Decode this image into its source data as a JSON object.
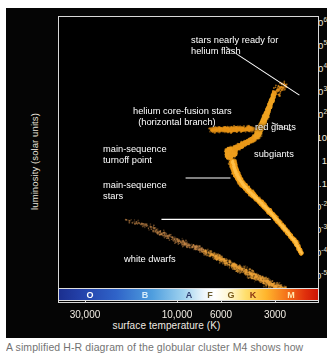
{
  "figure": {
    "background_color": "#050505",
    "plot_background": "#000000",
    "frame_color": "#d8d8d8",
    "text_color": "#ffffff",
    "star_color": "#f5a623",
    "caption": "A simplified H-R diagram of the globular cluster M4 shows how"
  },
  "chart_data": {
    "type": "scatter",
    "title": "",
    "xlabel": "surface temperature (K)",
    "ylabel": "luminosity (solar units)",
    "xscale": "log-reversed",
    "yscale": "log",
    "xlim": [
      45000,
      2400
    ],
    "ylim": [
      1e-05,
      1000000.0
    ],
    "grid": false,
    "legend_position": "none",
    "x_tick_labels": [
      "30,000",
      "10,000",
      "6000",
      "3000"
    ],
    "x_tick_values": [
      30000,
      10000,
      6000,
      3000
    ],
    "y_tick_labels": [
      "10⁶",
      "10⁵",
      "10⁴",
      "10³",
      "10²",
      "10",
      "1",
      "0.1",
      "10⁻²",
      "10⁻³",
      "10⁻⁴",
      "10⁻⁵"
    ],
    "y_tick_values": [
      1000000,
      100000,
      10000,
      1000,
      100,
      10,
      1,
      0.1,
      0.01,
      0.001,
      0.0001,
      1e-05
    ],
    "spectral_classes": [
      {
        "label": "O",
        "color": "#ffffff",
        "temp": 33000
      },
      {
        "label": "B",
        "color": "#cfe8fb",
        "temp": 15500
      },
      {
        "label": "A",
        "color": "#2a3a6b",
        "temp": 8800
      },
      {
        "label": "F",
        "color": "#6a5a2a",
        "temp": 7000
      },
      {
        "label": "G",
        "color": "#7a5a18",
        "temp": 5800
      },
      {
        "label": "K",
        "color": "#8a3410",
        "temp": 4500
      },
      {
        "label": "M",
        "color": "#ffe7b0",
        "temp": 3100
      }
    ],
    "series": [
      {
        "name": "main sequence",
        "description": "dense orange band from turnoff point down to low-mass dwarfs",
        "points": [
          [
            6400,
            3.0
          ],
          [
            6350,
            2.2
          ],
          [
            6280,
            1.6
          ],
          [
            6200,
            1.2
          ],
          [
            6120,
            0.95
          ],
          [
            6050,
            0.8
          ],
          [
            5950,
            0.62
          ],
          [
            5850,
            0.5
          ],
          [
            5700,
            0.38
          ],
          [
            5550,
            0.3
          ],
          [
            5400,
            0.24
          ],
          [
            5250,
            0.19
          ],
          [
            5100,
            0.15
          ],
          [
            4950,
            0.12
          ],
          [
            4800,
            0.095
          ],
          [
            4650,
            0.075
          ],
          [
            4500,
            0.058
          ],
          [
            4350,
            0.044
          ],
          [
            4200,
            0.033
          ],
          [
            4050,
            0.024
          ],
          [
            3900,
            0.017
          ],
          [
            3750,
            0.012
          ],
          [
            3600,
            0.0082
          ],
          [
            3450,
            0.0055
          ],
          [
            3300,
            0.0036
          ],
          [
            3150,
            0.0023
          ],
          [
            3050,
            0.0014
          ],
          [
            2950,
            0.00085
          ]
        ]
      },
      {
        "name": "main-sequence turnoff",
        "description": "hook where main sequence bends toward subgiants",
        "points": [
          [
            6600,
            4.0
          ],
          [
            6700,
            5.0
          ],
          [
            6750,
            6.2
          ],
          [
            6700,
            7.4
          ],
          [
            6550,
            8.2
          ],
          [
            6400,
            8.0
          ],
          [
            6300,
            6.8
          ],
          [
            6300,
            5.2
          ]
        ]
      },
      {
        "name": "subgiant branch",
        "description": "bridge from turnoff to red giant branch",
        "points": [
          [
            6200,
            9.0
          ],
          [
            6000,
            10.5
          ],
          [
            5800,
            12.0
          ],
          [
            5600,
            14.0
          ],
          [
            5400,
            16.0
          ],
          [
            5200,
            19.0
          ],
          [
            5000,
            23.0
          ]
        ]
      },
      {
        "name": "red giant branch",
        "description": "steeply rising branch of cool luminous giants",
        "points": [
          [
            4900,
            26
          ],
          [
            4820,
            33
          ],
          [
            4750,
            42
          ],
          [
            4680,
            55
          ],
          [
            4600,
            72
          ],
          [
            4540,
            95
          ],
          [
            4470,
            125
          ],
          [
            4400,
            165
          ],
          [
            4340,
            215
          ],
          [
            4280,
            290
          ],
          [
            4220,
            390
          ],
          [
            4160,
            520
          ],
          [
            4100,
            700
          ],
          [
            4050,
            950
          ],
          [
            4000,
            1250
          ]
        ]
      },
      {
        "name": "horizontal branch",
        "description": "helium core-fusion stars, roughly constant luminosity near 50 L☉",
        "points": [
          [
            8000,
            50
          ],
          [
            7600,
            48
          ],
          [
            7200,
            52
          ],
          [
            6900,
            46
          ],
          [
            6600,
            50
          ],
          [
            6300,
            47
          ],
          [
            6000,
            53
          ],
          [
            5700,
            49
          ],
          [
            5400,
            52
          ],
          [
            5150,
            48
          ]
        ]
      },
      {
        "name": "pre-helium-flash tip",
        "description": "sparse stars near the tip of the red giant branch",
        "points": [
          [
            3700,
            2000
          ],
          [
            3600,
            2300
          ],
          [
            3850,
            1500
          ],
          [
            3950,
            1150
          ]
        ]
      },
      {
        "name": "white dwarfs",
        "description": "faint hot degenerate remnants on a diagonal sequence",
        "points": [
          [
            22000,
            0.02
          ],
          [
            20500,
            0.016
          ],
          [
            19000,
            0.013
          ],
          [
            17500,
            0.0105
          ],
          [
            16000,
            0.0085
          ],
          [
            15000,
            0.0062
          ],
          [
            14000,
            0.0048
          ],
          [
            13000,
            0.0036
          ],
          [
            12000,
            0.0027
          ],
          [
            11000,
            0.0021
          ],
          [
            10000,
            0.0016
          ],
          [
            9200,
            0.0012
          ],
          [
            8500,
            0.00092
          ],
          [
            7900,
            0.0007
          ],
          [
            7300,
            0.00052
          ],
          [
            6800,
            0.0004
          ],
          [
            6300,
            0.0003
          ],
          [
            5900,
            0.00022
          ],
          [
            5500,
            0.00017
          ],
          [
            5100,
            0.00013
          ],
          [
            4800,
            0.0001
          ],
          [
            4500,
            8e-05
          ],
          [
            4200,
            6e-05
          ],
          [
            3900,
            4.5e-05
          ],
          [
            3650,
            3.4e-05
          ],
          [
            3400,
            2.6e-05
          ],
          [
            3200,
            2e-05
          ]
        ]
      }
    ]
  },
  "annotations": [
    {
      "id": "helium-flash",
      "text": "stars nearly ready for\nhelium flash",
      "align": "left"
    },
    {
      "id": "helium-core-fusion",
      "text": "helium core-fusion stars\n(horizontal branch)",
      "align": "left"
    },
    {
      "id": "red-giants",
      "text": "red giants",
      "align": "left"
    },
    {
      "id": "subgiants",
      "text": "subgiants",
      "align": "left"
    },
    {
      "id": "turnoff-point",
      "text": "main-sequence\nturnoff point",
      "align": "left"
    },
    {
      "id": "main-sequence-stars",
      "text": "main-sequence\nstars",
      "align": "left"
    },
    {
      "id": "white-dwarfs",
      "text": "white dwarfs",
      "align": "left"
    }
  ]
}
